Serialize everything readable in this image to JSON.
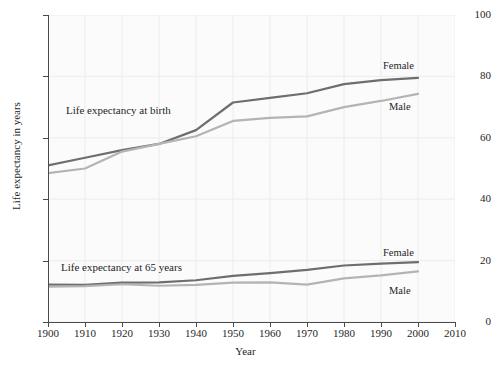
{
  "figure": {
    "y_axis_title": "Life expectancy in years",
    "x_axis_title": "Year"
  },
  "annotations": {
    "at_birth": "Life expectancy at birth",
    "at_65": "Life expectancy at 65 years"
  },
  "series_tags": {
    "birth_female": "Female",
    "birth_male": "Male",
    "age65_female": "Female",
    "age65_male": "Male"
  },
  "colors": {
    "female_line": "#6e6e6e",
    "male_line": "#b4b4b4",
    "axis": "#4a4a4a",
    "grid": "#ececec",
    "plot_background": "#fbfbfb",
    "text": "#1f1f1f"
  },
  "chart_data": {
    "type": "line",
    "title": "",
    "xlabel": "Year",
    "ylabel": "Life expectancy in years",
    "xlim": [
      1900,
      2010
    ],
    "ylim": [
      0,
      100
    ],
    "grid": true,
    "legend_position": "inline-labels",
    "xticks": [
      1900,
      1910,
      1920,
      1930,
      1940,
      1950,
      1960,
      1970,
      1980,
      1990,
      2000,
      2010
    ],
    "yticks": [
      0,
      20,
      40,
      60,
      80,
      100
    ],
    "x": [
      1900,
      1910,
      1920,
      1930,
      1940,
      1950,
      1960,
      1970,
      1980,
      1990,
      2000
    ],
    "series": [
      {
        "name": "Female",
        "group": "Life expectancy at birth",
        "color": "#6e6e6e",
        "values": [
          51.0,
          53.5,
          56.0,
          58.0,
          62.5,
          71.5,
          73.0,
          74.5,
          77.5,
          78.8,
          79.5
        ]
      },
      {
        "name": "Male",
        "group": "Life expectancy at birth",
        "color": "#b4b4b4",
        "values": [
          48.5,
          50.0,
          55.5,
          58.0,
          60.5,
          65.5,
          66.5,
          67.0,
          70.0,
          72.0,
          74.3
        ]
      },
      {
        "name": "Female",
        "group": "Life expectancy at 65 years",
        "color": "#6e6e6e",
        "values": [
          12.2,
          12.1,
          12.8,
          12.9,
          13.6,
          15.0,
          15.9,
          17.0,
          18.4,
          19.0,
          19.5
        ]
      },
      {
        "name": "Male",
        "group": "Life expectancy at 65 years",
        "color": "#b4b4b4",
        "values": [
          11.5,
          11.7,
          12.3,
          11.8,
          12.1,
          12.8,
          12.9,
          12.2,
          14.2,
          15.2,
          16.5
        ]
      }
    ]
  }
}
